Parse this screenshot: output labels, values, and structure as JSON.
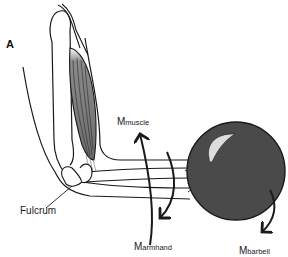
{
  "figure": {
    "panel_label": "A",
    "colors": {
      "line": "#1a1a1a",
      "muscle_fill": "#6e6e6e",
      "barbell_fill": "#4a4a4a",
      "barbell_highlight": "#d9d9d9",
      "background": "#ffffff"
    },
    "labels": {
      "fulcrum": "Fulcrum",
      "m_muscle": {
        "main": "M",
        "sub": "muscle"
      },
      "m_armhand": {
        "main": "M",
        "sub": "armhand"
      },
      "m_barbell": {
        "main": "M",
        "sub": "barbell"
      }
    }
  }
}
